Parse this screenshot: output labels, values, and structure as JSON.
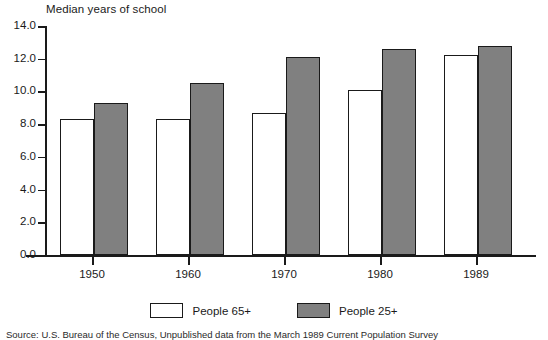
{
  "chart_data": {
    "type": "bar",
    "title": "Median years of school",
    "xlabel": "",
    "ylabel": "",
    "categories": [
      "1950",
      "1960",
      "1970",
      "1980",
      "1989"
    ],
    "series": [
      {
        "name": "People 65+",
        "color": "#ffffff",
        "values": [
          8.3,
          8.3,
          8.7,
          10.1,
          12.2
        ]
      },
      {
        "name": "People 25+",
        "color": "#808080",
        "values": [
          9.3,
          10.5,
          12.1,
          12.6,
          12.8
        ]
      }
    ],
    "ylim": [
      0.0,
      14.0
    ],
    "ytick_labels": [
      "0.0",
      "2.0",
      "4.0",
      "6.0",
      "8.0",
      "10.0",
      "12.0",
      "14.0"
    ],
    "ytick_values": [
      0,
      2,
      4,
      6,
      8,
      10,
      12,
      14
    ],
    "grid": false,
    "legend_position": "bottom"
  },
  "legend": {
    "items": [
      {
        "label": "People 65+",
        "swatch": "white"
      },
      {
        "label": "People 25+",
        "swatch": "gray"
      }
    ]
  },
  "source_note": "Source:  U.S. Bureau of the Census, Unpublished data from the March 1989 Current Population Survey"
}
